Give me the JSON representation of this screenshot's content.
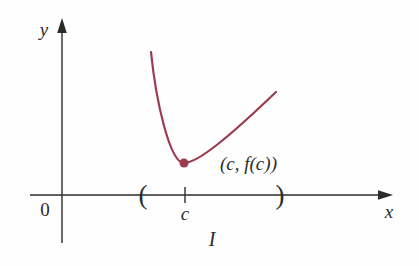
{
  "figure": {
    "type": "function-graph-sketch",
    "background": "#fefefe",
    "axis_color": "#2b2b2b",
    "curve_color": "#9c3a50",
    "labels": {
      "y_axis": "y",
      "x_axis": "x",
      "origin": "0",
      "c_tick": "c",
      "interval": "I",
      "minimum_point": "(c,  f(c))",
      "interval_open_paren": "(",
      "interval_close_paren": ")"
    }
  }
}
